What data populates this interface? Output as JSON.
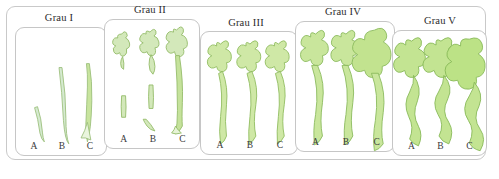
{
  "figure": {
    "type": "medical-grading-scale",
    "language": "de",
    "specimen_color_fill": "#cfe8a6",
    "specimen_color_fill_light": "#e8f4d4",
    "specimen_color_stroke": "#8fbc5f",
    "card_border_color": "#c6c6c6",
    "frame_border_color": "#c9c9c9",
    "background_color": "#ffffff",
    "text_color": "#2b2b2b"
  },
  "panels": [
    {
      "id": "grau-1",
      "title": "Grau I",
      "severity_rank": 1,
      "specimen_labels": [
        "A",
        "B",
        "C"
      ],
      "specimens": [
        {
          "label": "A",
          "form": "thin-short-curved-strand",
          "has_branching_head": false,
          "relative_length": 0.3,
          "relative_width": 0.12
        },
        {
          "label": "B",
          "form": "thin-long-curved-strand",
          "has_branching_head": false,
          "relative_length": 0.75,
          "relative_width": 0.14
        },
        {
          "label": "C",
          "form": "long-strand-with-flared-base",
          "has_branching_head": false,
          "relative_length": 0.8,
          "relative_width": 0.22
        }
      ]
    },
    {
      "id": "grau-2",
      "title": "Grau II",
      "severity_rank": 2,
      "specimen_labels": [
        "A",
        "B",
        "C"
      ],
      "specimens": [
        {
          "label": "A",
          "form": "small-branched-head-plus-detached-stub",
          "has_branching_head": true,
          "relative_length": 0.35,
          "relative_width": 0.2
        },
        {
          "label": "B",
          "form": "branched-head-plus-two-detached-segments",
          "has_branching_head": true,
          "relative_length": 0.5,
          "relative_width": 0.26
        },
        {
          "label": "C",
          "form": "branched-head-with-long-continuous-stem",
          "has_branching_head": true,
          "relative_length": 0.85,
          "relative_width": 0.28
        }
      ]
    },
    {
      "id": "grau-3",
      "title": "Grau III",
      "severity_rank": 3,
      "specimen_labels": [
        "A",
        "B",
        "C"
      ],
      "specimens": [
        {
          "label": "A",
          "form": "branched-head-with-full-wavy-stem",
          "has_branching_head": true,
          "relative_length": 0.9,
          "relative_width": 0.32
        },
        {
          "label": "B",
          "form": "branched-head-with-full-wavy-stem",
          "has_branching_head": true,
          "relative_length": 0.9,
          "relative_width": 0.34
        },
        {
          "label": "C",
          "form": "branched-head-with-full-wavy-stem",
          "has_branching_head": true,
          "relative_length": 0.9,
          "relative_width": 0.36
        }
      ]
    },
    {
      "id": "grau-4",
      "title": "Grau IV",
      "severity_rank": 4,
      "specimen_labels": [
        "A",
        "B",
        "C"
      ],
      "specimens": [
        {
          "label": "A",
          "form": "large-branched-head-with-thick-stem",
          "has_branching_head": true,
          "relative_length": 0.92,
          "relative_width": 0.4
        },
        {
          "label": "B",
          "form": "large-branched-head-with-thick-stem",
          "has_branching_head": true,
          "relative_length": 0.92,
          "relative_width": 0.42
        },
        {
          "label": "C",
          "form": "bulbous-head-with-thick-stem",
          "has_branching_head": true,
          "relative_length": 0.92,
          "relative_width": 0.55
        }
      ]
    },
    {
      "id": "grau-5",
      "title": "Grau V",
      "severity_rank": 5,
      "specimen_labels": [
        "A",
        "B",
        "C"
      ],
      "specimens": [
        {
          "label": "A",
          "form": "branched-head-with-tortuous-body",
          "has_branching_head": true,
          "relative_length": 0.94,
          "relative_width": 0.48
        },
        {
          "label": "B",
          "form": "branched-head-with-strongly-tortuous-body",
          "has_branching_head": true,
          "relative_length": 0.94,
          "relative_width": 0.55
        },
        {
          "label": "C",
          "form": "massive-bulbous-tortuous-body",
          "has_branching_head": true,
          "relative_length": 0.94,
          "relative_width": 0.7
        }
      ]
    }
  ]
}
